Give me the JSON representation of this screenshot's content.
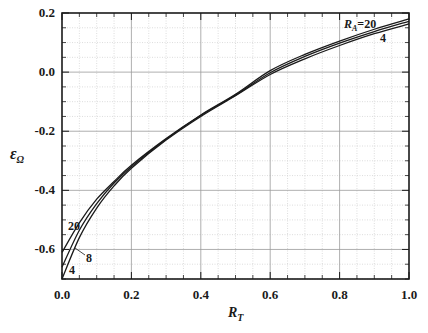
{
  "chart_data": {
    "type": "line",
    "title": "",
    "xlabel": "R_T",
    "ylabel": "ε_Ω",
    "xlim": [
      0.0,
      1.0
    ],
    "ylim": [
      -0.7,
      0.2
    ],
    "xticks": [
      "0.0",
      "0.2",
      "0.4",
      "0.6",
      "0.8",
      "1.0"
    ],
    "yticks": [
      "0.2",
      "0.0",
      "-0.2",
      "-0.4",
      "-0.6"
    ],
    "grid": true,
    "legend": "inline annotations",
    "annotations": [
      {
        "text": "R_A=20",
        "near": "upper right, top curve"
      },
      {
        "text": "4",
        "near": "upper right, bottom curve"
      },
      {
        "text": "20",
        "near": "lower left, top curve"
      },
      {
        "text": "8",
        "near": "lower left, middle curve"
      },
      {
        "text": "4",
        "near": "lower left, bottom curve"
      }
    ],
    "x": [
      0.0,
      0.05,
      0.1,
      0.15,
      0.2,
      0.3,
      0.4,
      0.5,
      0.6,
      0.7,
      0.8,
      0.9,
      1.0
    ],
    "series": [
      {
        "name": "R_A=20",
        "values": [
          -0.61,
          -0.51,
          -0.43,
          -0.37,
          -0.315,
          -0.225,
          -0.145,
          -0.075,
          0.005,
          0.06,
          0.105,
          0.145,
          0.18
        ]
      },
      {
        "name": "R_A=8",
        "values": [
          -0.66,
          -0.535,
          -0.445,
          -0.375,
          -0.32,
          -0.227,
          -0.147,
          -0.078,
          -0.002,
          0.053,
          0.098,
          0.137,
          0.172
        ]
      },
      {
        "name": "R_A=4",
        "values": [
          -0.7,
          -0.56,
          -0.46,
          -0.385,
          -0.325,
          -0.23,
          -0.15,
          -0.08,
          -0.008,
          0.045,
          0.09,
          0.13,
          0.163
        ]
      }
    ]
  },
  "labels": {
    "xlabel_main": "R",
    "xlabel_sub": "T",
    "ylabel_main": "ε",
    "ylabel_sub": "Ω",
    "anno_ra_main": "R",
    "anno_ra_sub": "A",
    "anno_ra_val": "=20",
    "anno_top_4": "4",
    "anno_bot_20": "20",
    "anno_bot_8": "8",
    "anno_bot_4": "4"
  },
  "style": {
    "line_color": "#1a1a1a",
    "grid_major_color": "#9a9a9a",
    "grid_minor_color": "#cfcfcf"
  }
}
